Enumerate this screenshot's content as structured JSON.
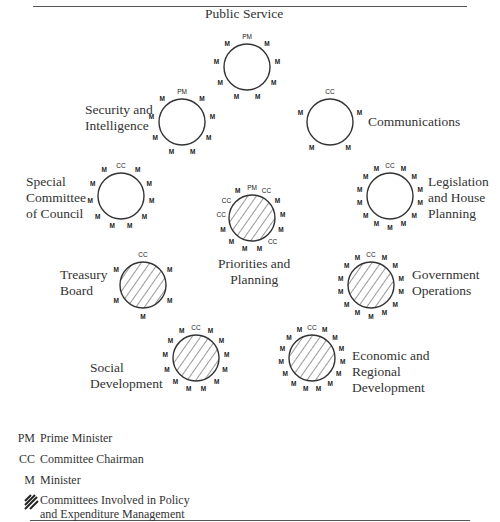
{
  "committees": [
    {
      "id": "public-service",
      "label": "Public Service",
      "cx": 247,
      "cy": 67,
      "r": 23,
      "hatched": false,
      "label_pos": {
        "x": 205,
        "y": 6
      },
      "members": [
        "PM",
        "M",
        "M",
        "M",
        "M",
        "M",
        "M",
        "M",
        "M"
      ]
    },
    {
      "id": "security-intelligence",
      "label": "Security and\nIntelligence",
      "cx": 182,
      "cy": 122,
      "r": 23,
      "hatched": false,
      "label_pos": {
        "x": 85,
        "y": 102
      },
      "members": [
        "PM",
        "M",
        "M",
        "M",
        "M",
        "M",
        "M",
        "M",
        "M"
      ]
    },
    {
      "id": "communications",
      "label": "Communications",
      "cx": 330,
      "cy": 122,
      "r": 23,
      "hatched": false,
      "label_pos": {
        "x": 368,
        "y": 114
      },
      "members": [
        "CC",
        "M",
        "M",
        "M",
        "M"
      ]
    },
    {
      "id": "special-committee-of-council",
      "label": "Special\nCommittee\nof Council",
      "cx": 121,
      "cy": 196,
      "r": 23,
      "hatched": false,
      "label_pos": {
        "x": 26,
        "y": 174
      },
      "members": [
        "CC",
        "M",
        "M",
        "M",
        "M",
        "M",
        "M",
        "M",
        "M",
        "M",
        "M"
      ]
    },
    {
      "id": "legislation-house-planning",
      "label": "Legislation\nand House\nPlanning",
      "cx": 390,
      "cy": 196,
      "r": 23,
      "hatched": false,
      "label_pos": {
        "x": 428,
        "y": 174
      },
      "members": [
        "CC",
        "M",
        "M",
        "M",
        "M",
        "M",
        "M",
        "M",
        "M",
        "M",
        "M",
        "M",
        "M",
        "M"
      ]
    },
    {
      "id": "priorities-planning",
      "label": "Priorities and\nPlanning",
      "cx": 252,
      "cy": 218,
      "r": 23,
      "hatched": true,
      "label_pos": {
        "x": 218,
        "y": 256
      },
      "members": [
        "PM",
        "CC",
        "M",
        "M",
        "M",
        "CC",
        "M",
        "M",
        "M",
        "M",
        "CC",
        "CC",
        "M"
      ]
    },
    {
      "id": "treasury-board",
      "label": "Treasury\nBoard",
      "cx": 143,
      "cy": 285,
      "r": 23,
      "hatched": true,
      "label_pos": {
        "x": 60,
        "y": 267
      },
      "members": [
        "CC",
        "M",
        "M",
        "M",
        "M",
        "M"
      ]
    },
    {
      "id": "government-operations",
      "label": "Government\nOperations",
      "cx": 371,
      "cy": 285,
      "r": 23,
      "hatched": true,
      "label_pos": {
        "x": 412,
        "y": 267
      },
      "members": [
        "CC",
        "M",
        "M",
        "M",
        "M",
        "M",
        "M",
        "M",
        "M",
        "M",
        "M",
        "M",
        "M",
        "M"
      ]
    },
    {
      "id": "social-development",
      "label": "Social\nDevelopment",
      "cx": 196,
      "cy": 358,
      "r": 23,
      "hatched": true,
      "label_pos": {
        "x": 90,
        "y": 360
      },
      "members": [
        "CC",
        "M",
        "M",
        "M",
        "M",
        "M",
        "M",
        "M",
        "M",
        "M",
        "M",
        "M",
        "M"
      ]
    },
    {
      "id": "economic-regional-development",
      "label": "Economic and\nRegional\nDevelopment",
      "cx": 312,
      "cy": 358,
      "r": 23,
      "hatched": true,
      "label_pos": {
        "x": 352,
        "y": 348
      },
      "members": [
        "CC",
        "M",
        "M",
        "M",
        "M",
        "M",
        "M",
        "M",
        "M",
        "M",
        "M",
        "M",
        "M",
        "M",
        "M"
      ]
    }
  ],
  "legend": [
    {
      "key": "PM",
      "text": "Prime Minister"
    },
    {
      "key": "CC",
      "text": "Committee Chairman"
    },
    {
      "key": "M",
      "text": "Minister"
    },
    {
      "key": "hatch",
      "text": "Committees Involved in Policy\nand Expenditure Management"
    }
  ],
  "colors": {
    "stroke": "#333333",
    "text": "#333333",
    "rule": "#555555"
  }
}
